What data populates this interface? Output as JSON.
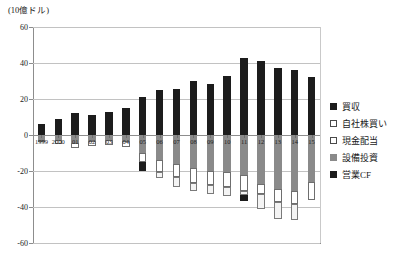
{
  "unit_label": "(10億ドル)",
  "legend": {
    "items": [
      {
        "label": "買収",
        "key": "acq",
        "color": "#1c1c1c"
      },
      {
        "label": "自社株買い",
        "key": "buyback",
        "color": "#ffffff"
      },
      {
        "label": "現金配当",
        "key": "div",
        "color": "#ffffff"
      },
      {
        "label": "設備投資",
        "key": "capex",
        "color": "#8a8a8a"
      },
      {
        "label": "営業CF",
        "key": "ocf",
        "color": "#1c1c1c"
      }
    ]
  },
  "axis": {
    "y_ticks": [
      "60",
      "40",
      "20",
      "0",
      "-20",
      "-40",
      "-60"
    ],
    "y_values": [
      60,
      40,
      20,
      0,
      -20,
      -40,
      -60
    ],
    "ylim": [
      -60,
      60
    ],
    "grid": true
  },
  "chart_data": {
    "type": "bar",
    "title": "",
    "subtitle": "",
    "xlabel": "",
    "ylabel": "(10億ドル)",
    "ylim": [
      -60,
      60
    ],
    "grid": true,
    "legend_position": "right",
    "stacked": true,
    "categories": [
      "1999",
      "2000",
      "01",
      "02",
      "03",
      "04",
      "05",
      "06",
      "07",
      "08",
      "09",
      "10",
      "11",
      "12",
      "13",
      "14",
      "15"
    ],
    "series": [
      {
        "name": "営業CF",
        "key": "ocf",
        "sign": "positive",
        "values": [
          6,
          9,
          12,
          11,
          13,
          15,
          21,
          25,
          25.5,
          30,
          28.5,
          33,
          43,
          41,
          37,
          36,
          32
        ]
      },
      {
        "name": "設備投資",
        "key": "capex",
        "sign": "negative",
        "values": [
          -2.5,
          -3,
          -4.5,
          -3.5,
          -3,
          -3.5,
          -10,
          -14,
          -16,
          -18.5,
          -20,
          -20.5,
          -22,
          -27,
          -30,
          -31,
          -26
        ]
      },
      {
        "name": "現金配当",
        "key": "div",
        "sign": "negative",
        "values": [
          -1.5,
          -2,
          -3,
          -2.5,
          -2.5,
          -3,
          -5,
          -6.5,
          -7.5,
          -8,
          -8,
          -8.5,
          -9,
          -6,
          -7,
          -7.5,
          -10
        ]
      },
      {
        "name": "自社株買い",
        "key": "buyback",
        "sign": "negative",
        "values": [
          0,
          0,
          0,
          0,
          0,
          0,
          0,
          -3.5,
          -5.5,
          -4.5,
          -5,
          -5,
          -2.5,
          -8,
          -9.5,
          -8.5,
          0
        ]
      },
      {
        "name": "買収",
        "key": "acq",
        "sign": "negative",
        "values": [
          0,
          0,
          0,
          0,
          0,
          0,
          -5,
          0,
          0,
          0,
          0,
          0,
          -3,
          0,
          0,
          0,
          0
        ]
      }
    ],
    "totals_positive": [
      6,
      9,
      12,
      11,
      13,
      15,
      21,
      25,
      25.5,
      30,
      28.5,
      33,
      43,
      41,
      37,
      36,
      32
    ],
    "totals_negative": [
      -4,
      -5,
      -7.5,
      -6,
      -5.5,
      -6.5,
      -20,
      -24,
      -29,
      -31,
      -33,
      -34,
      -36.5,
      -41,
      -46.5,
      -47,
      -36
    ]
  }
}
